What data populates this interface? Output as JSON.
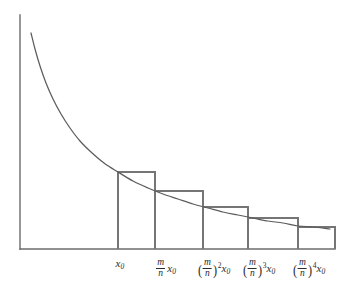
{
  "figure": {
    "background_color": "#ffffff",
    "line_color": "#6b6b6b",
    "curve_color": "#5c5c5c",
    "rect_color": "#757575",
    "text_color": "#2b2b2b"
  },
  "chart_data": {
    "type": "area",
    "title": "",
    "subtitle": "",
    "xlabel": "",
    "ylabel": "",
    "grid": false,
    "legend": null,
    "axes": {
      "y_axis": {
        "x": 20,
        "y_top": 15,
        "y_bottom": 249
      },
      "x_axis": {
        "y": 249,
        "x_left": 20,
        "x_right": 335
      }
    },
    "curve": {
      "description": "monotone decreasing convex curve, hyperbola-like y = k/x",
      "start_point": [
        31,
        33
      ],
      "end_point": [
        330,
        229
      ],
      "points": [
        [
          31,
          33
        ],
        [
          35,
          49
        ],
        [
          40,
          66
        ],
        [
          46,
          83
        ],
        [
          53,
          99
        ],
        [
          61,
          114
        ],
        [
          70,
          128
        ],
        [
          80,
          141
        ],
        [
          91,
          152
        ],
        [
          104,
          163
        ],
        [
          118,
          172
        ],
        [
          133,
          181
        ],
        [
          148,
          188
        ],
        [
          163,
          194
        ],
        [
          178,
          199
        ],
        [
          193,
          204
        ],
        [
          208,
          208
        ],
        [
          223,
          212
        ],
        [
          238,
          215
        ],
        [
          253,
          218
        ],
        [
          268,
          221
        ],
        [
          283,
          223
        ],
        [
          298,
          226
        ],
        [
          313,
          227
        ],
        [
          330,
          229
        ]
      ]
    },
    "rectangles": [
      {
        "index": 1,
        "x_left": 118,
        "x_right": 155,
        "y_top": 172,
        "y_bottom": 249
      },
      {
        "index": 2,
        "x_left": 155,
        "x_right": 203,
        "y_top": 191,
        "y_bottom": 249
      },
      {
        "index": 3,
        "x_left": 203,
        "x_right": 248,
        "y_top": 207,
        "y_bottom": 249
      },
      {
        "index": 4,
        "x_left": 248,
        "x_right": 298,
        "y_top": 218,
        "y_bottom": 249
      },
      {
        "index": 5,
        "x_left": 298,
        "x_right": 335,
        "y_top": 227,
        "y_bottom": 249
      }
    ],
    "x_tick_positions": [
      120,
      166,
      214,
      259,
      309
    ],
    "x_tick_labels": [
      "x₀",
      "(m/n) x₀",
      "(m/n)² x₀",
      "(m/n)³ x₀",
      "(m/n)⁴ x₀"
    ]
  },
  "labels": {
    "variable_x": "x",
    "subscript_zero": "0",
    "numerator": "m",
    "denominator": "n",
    "paren_open": "(",
    "paren_close": ")",
    "exponent_2": "2",
    "exponent_3": "3",
    "exponent_4": "4"
  }
}
